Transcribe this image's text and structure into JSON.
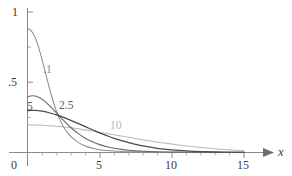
{
  "chart_data": {
    "type": "line",
    "title": "",
    "subtitle": "",
    "xlabel": "x",
    "ylabel": "",
    "xlim": [
      0,
      15.6
    ],
    "ylim": [
      0,
      1.02
    ],
    "grid": false,
    "legend": "inline-curve-labels",
    "x_ticks": [
      {
        "value": 0,
        "label": "0"
      },
      {
        "value": 5,
        "label": "5"
      },
      {
        "value": 10,
        "label": "10"
      },
      {
        "value": 15,
        "label": "15"
      }
    ],
    "x_minor_ticks": [
      1,
      2,
      3,
      4,
      6,
      7,
      8,
      9,
      11,
      12,
      13,
      14
    ],
    "y_ticks": [
      {
        "value": 0.5,
        "label": ".5"
      },
      {
        "value": 1.0,
        "label": "1"
      }
    ],
    "y_minor_ticks": [
      0.25,
      0.75
    ],
    "axis_arrow": "x-axis-arrow",
    "series": [
      {
        "name": ".1",
        "label": ".1",
        "color": "#8c8c8c",
        "label_position": {
          "x": 1.9,
          "y": 0.6
        },
        "x": [
          0,
          0.15,
          0.3,
          0.5,
          0.75,
          1.0,
          1.25,
          1.5,
          1.75,
          2.0,
          2.25,
          2.5,
          2.75,
          3.0,
          3.5,
          4.0,
          4.5,
          5.0,
          5.5,
          6.0,
          6.5,
          7.0,
          7.5,
          8.0,
          9.0,
          10.0,
          11.0,
          12.0,
          13.0,
          14.0,
          15.0
        ],
        "y": [
          0.88,
          0.875,
          0.86,
          0.825,
          0.755,
          0.665,
          0.565,
          0.465,
          0.375,
          0.295,
          0.232,
          0.182,
          0.143,
          0.115,
          0.072,
          0.046,
          0.03,
          0.02,
          0.014,
          0.01,
          0.007,
          0.005,
          0.004,
          0.003,
          0.002,
          0.001,
          0.001,
          0.0,
          0.0,
          0.0,
          0.0
        ]
      },
      {
        "name": ".5",
        "label": "5",
        "color": "#6a6a6a",
        "label_position": {
          "x": 0.35,
          "y": 0.345
        },
        "x": [
          0,
          0.2,
          0.4,
          0.6,
          0.8,
          1.0,
          1.25,
          1.5,
          1.75,
          2.0,
          2.5,
          3.0,
          3.5,
          4.0,
          4.5,
          5.0,
          5.5,
          6.0,
          6.5,
          7.0,
          7.5,
          8.0,
          8.5,
          9.0,
          10.0,
          11.0,
          12.0,
          13.0,
          14.0,
          15.0
        ],
        "y": [
          0.395,
          0.402,
          0.404,
          0.4,
          0.392,
          0.38,
          0.36,
          0.336,
          0.31,
          0.283,
          0.228,
          0.178,
          0.136,
          0.102,
          0.076,
          0.056,
          0.041,
          0.03,
          0.022,
          0.016,
          0.012,
          0.009,
          0.007,
          0.005,
          0.003,
          0.002,
          0.001,
          0.001,
          0.0,
          0.0
        ]
      },
      {
        "name": "2.5",
        "label": "2.5",
        "color": "#4a4a4a",
        "label_position": {
          "x": 2.95,
          "y": 0.345
        },
        "x": [
          0,
          0.25,
          0.5,
          0.75,
          1.0,
          1.5,
          2.0,
          2.5,
          3.0,
          3.5,
          4.0,
          4.5,
          5.0,
          5.5,
          6.0,
          6.5,
          7.0,
          7.5,
          8.0,
          8.5,
          9.0,
          9.5,
          10.0,
          11.0,
          12.0,
          13.0,
          14.0,
          15.0
        ],
        "y": [
          0.298,
          0.3,
          0.3,
          0.298,
          0.294,
          0.283,
          0.268,
          0.25,
          0.229,
          0.207,
          0.184,
          0.162,
          0.14,
          0.12,
          0.101,
          0.085,
          0.07,
          0.058,
          0.047,
          0.038,
          0.03,
          0.024,
          0.019,
          0.012,
          0.007,
          0.004,
          0.003,
          0.002
        ]
      },
      {
        "name": "10",
        "label": "10",
        "color": "#b9b9b9",
        "label_position": {
          "x": 6.55,
          "y": 0.215
        },
        "x": [
          0,
          0.5,
          1.0,
          1.5,
          2.0,
          2.5,
          3.0,
          3.5,
          4.0,
          4.5,
          5.0,
          5.5,
          6.0,
          6.5,
          7.0,
          7.5,
          8.0,
          8.5,
          9.0,
          9.5,
          10.0,
          10.5,
          11.0,
          11.5,
          12.0,
          13.0,
          14.0,
          15.0
        ],
        "y": [
          0.197,
          0.196,
          0.194,
          0.191,
          0.187,
          0.182,
          0.176,
          0.169,
          0.161,
          0.153,
          0.144,
          0.135,
          0.126,
          0.117,
          0.108,
          0.099,
          0.09,
          0.082,
          0.074,
          0.067,
          0.06,
          0.053,
          0.047,
          0.041,
          0.036,
          0.027,
          0.019,
          0.013
        ]
      }
    ]
  },
  "axes": {
    "x_axis_name": "x",
    "origin_label": "0",
    "y_label_half": ".5",
    "y_label_one": "1",
    "x_label_five": "5",
    "x_label_ten": "10",
    "x_label_fifteen": "15"
  },
  "labels": {
    "curve_a": ".1",
    "curve_b": "5",
    "curve_c": "2.5",
    "curve_d": "10"
  },
  "colors": {
    "axis": "#8a8a8a",
    "text": "#3a3a3a",
    "curve_a": "#8c8c8c",
    "curve_b": "#6a6a6a",
    "curve_c": "#4a4a4a",
    "curve_d": "#b9b9b9",
    "background": "#ffffff"
  }
}
